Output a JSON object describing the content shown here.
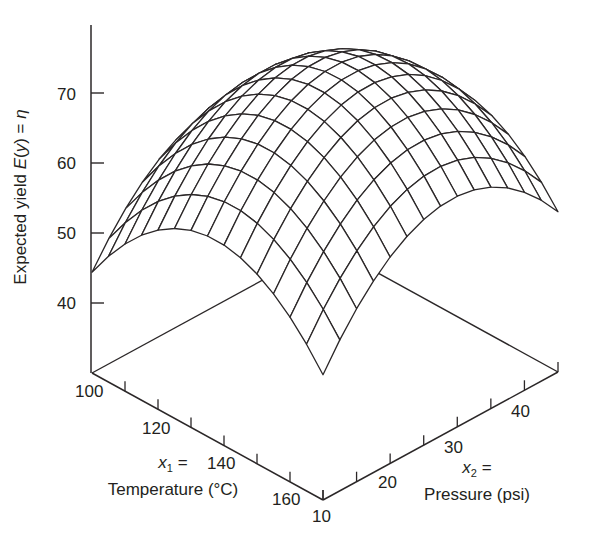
{
  "chart_data": {
    "type": "surface3d",
    "title": "",
    "zlabel": "Expected yield E(y) = η",
    "zlabel_parts": {
      "prefix": "Expected yield ",
      "func": "E",
      "arg": "(y)",
      "eq": " = ",
      "eta": "η"
    },
    "x1_axis": {
      "var": "x",
      "sub": "1",
      "eq": " =",
      "name": "Temperature (°C)",
      "range": [
        100,
        170
      ],
      "ticks": [
        100,
        110,
        120,
        130,
        140,
        150,
        160,
        170
      ],
      "tick_labels": [
        "100",
        "120",
        "140",
        "160"
      ]
    },
    "x2_axis": {
      "var": "x",
      "sub": "2",
      "eq": " =",
      "name": "Pressure (psi)",
      "range": [
        10,
        45
      ],
      "ticks": [
        10,
        15,
        20,
        25,
        30,
        35,
        40,
        45
      ],
      "tick_labels": [
        "10",
        "20",
        "30",
        "40"
      ]
    },
    "z_axis": {
      "range": [
        30,
        80
      ],
      "ticks": [
        40,
        50,
        60,
        70
      ],
      "tick_labels": [
        "40",
        "50",
        "60",
        "70"
      ]
    },
    "surface": {
      "model": "quadratic in coded units t=(T-135)/35, p=(P-27.5)/17.5",
      "coefficients": {
        "b0": 73.0,
        "b1": 2.35,
        "b2": 1.9,
        "b11": -12.5,
        "b22": -12.45,
        "b12": 0.6
      },
      "grid_divisions": [
        14,
        14
      ],
      "peak_yield_approx": 73,
      "corner_yields": {
        "T100_P10": 44.4,
        "T170_P10": 47.9,
        "T170_P45": 52.9,
        "T100_P45": 47.0
      }
    },
    "grid": false,
    "legend": null
  }
}
